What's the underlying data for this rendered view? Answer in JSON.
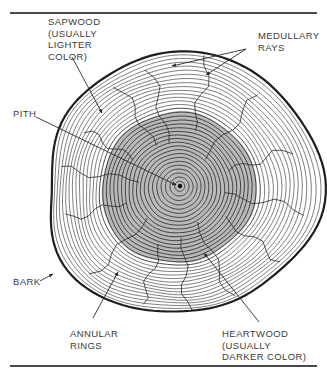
{
  "diagram": {
    "colors": {
      "line": "#2a2a2a",
      "bark": "#1e1e1e",
      "heartwood_fill": "#b9b9b9",
      "text": "#3a3a3a",
      "background": "#ffffff"
    },
    "labels": {
      "sapwood": "SAPWOOD\n(USUALLY\nLIGHTER\nCOLOR)",
      "medullary_rays": "MEDULLARY\nRAYS",
      "pith": "PITH",
      "bark": "BARK",
      "annular_rings": "ANNULAR\nRINGS",
      "heartwood": "HEARTWOOD\n(USUALLY\nDARKER COLOR)"
    },
    "pith_center": [
      180,
      186
    ],
    "ring_count": 34,
    "heartwood_ring_count": 20,
    "ray_count": 14
  }
}
